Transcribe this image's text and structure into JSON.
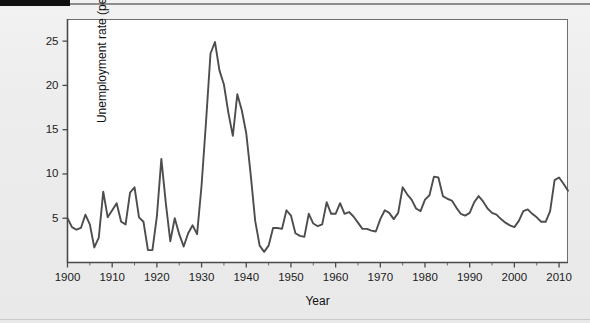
{
  "page": {
    "background_color": "#ececec",
    "tab_color": "#111111",
    "rule_color": "#8d8d8d"
  },
  "chart_data": {
    "type": "line",
    "title": "",
    "subtitle": "",
    "xlabel": "Year",
    "ylabel": "Unemployment rate (percent)",
    "xlim": [
      1900,
      2012
    ],
    "ylim": [
      0,
      27.5
    ],
    "grid": false,
    "legend": false,
    "legend_position": "none",
    "line_color": "#4d4d4d",
    "plot_background": "#ffffff",
    "frame_color": "#6e6e6e",
    "xticks": [
      1900,
      1910,
      1920,
      1930,
      1940,
      1950,
      1960,
      1970,
      1980,
      1990,
      2000,
      2010
    ],
    "xtick_labels": [
      "1900",
      "1910",
      "1920",
      "1930",
      "1940",
      "1950",
      "1960",
      "1970",
      "1980",
      "1990",
      "2000",
      "2010"
    ],
    "yticks": [
      5,
      10,
      15,
      20,
      25
    ],
    "ytick_labels": [
      "5",
      "10",
      "15",
      "20",
      "25"
    ],
    "series": [
      {
        "name": "Unemployment rate",
        "x": [
          1900,
          1901,
          1902,
          1903,
          1904,
          1905,
          1906,
          1907,
          1908,
          1909,
          1910,
          1911,
          1912,
          1913,
          1914,
          1915,
          1916,
          1917,
          1918,
          1919,
          1920,
          1921,
          1922,
          1923,
          1924,
          1925,
          1926,
          1927,
          1928,
          1929,
          1930,
          1931,
          1932,
          1933,
          1934,
          1935,
          1936,
          1937,
          1938,
          1939,
          1940,
          1941,
          1942,
          1943,
          1944,
          1945,
          1946,
          1947,
          1948,
          1949,
          1950,
          1951,
          1952,
          1953,
          1954,
          1955,
          1956,
          1957,
          1958,
          1959,
          1960,
          1961,
          1962,
          1963,
          1964,
          1965,
          1966,
          1967,
          1968,
          1969,
          1970,
          1971,
          1972,
          1973,
          1974,
          1975,
          1976,
          1977,
          1978,
          1979,
          1980,
          1981,
          1982,
          1983,
          1984,
          1985,
          1986,
          1987,
          1988,
          1989,
          1990,
          1991,
          1992,
          1993,
          1994,
          1995,
          1996,
          1997,
          1998,
          1999,
          2000,
          2001,
          2002,
          2003,
          2004,
          2005,
          2006,
          2007,
          2008,
          2009,
          2010,
          2011,
          2012
        ],
        "values": [
          5.0,
          4.0,
          3.7,
          3.9,
          5.4,
          4.3,
          1.7,
          2.8,
          8.0,
          5.1,
          5.9,
          6.7,
          4.6,
          4.3,
          7.9,
          8.5,
          5.1,
          4.6,
          1.4,
          1.4,
          5.2,
          11.7,
          6.7,
          2.4,
          5.0,
          3.2,
          1.8,
          3.3,
          4.2,
          3.2,
          8.7,
          15.9,
          23.6,
          24.9,
          21.7,
          20.1,
          16.9,
          14.3,
          19.0,
          17.2,
          14.6,
          9.9,
          4.7,
          1.9,
          1.2,
          1.9,
          3.9,
          3.9,
          3.8,
          5.9,
          5.3,
          3.3,
          3.0,
          2.9,
          5.5,
          4.4,
          4.1,
          4.3,
          6.8,
          5.5,
          5.5,
          6.7,
          5.5,
          5.7,
          5.2,
          4.5,
          3.8,
          3.8,
          3.6,
          3.5,
          4.9,
          5.9,
          5.6,
          4.9,
          5.6,
          8.5,
          7.7,
          7.1,
          6.1,
          5.8,
          7.1,
          7.6,
          9.7,
          9.6,
          7.5,
          7.2,
          7.0,
          6.2,
          5.5,
          5.3,
          5.6,
          6.8,
          7.5,
          6.9,
          6.1,
          5.6,
          5.4,
          4.9,
          4.5,
          4.2,
          4.0,
          4.7,
          5.8,
          6.0,
          5.5,
          5.1,
          4.6,
          4.6,
          5.8,
          9.3,
          9.6,
          8.9,
          8.1
        ],
        "units": "percent"
      }
    ],
    "annotations": []
  }
}
